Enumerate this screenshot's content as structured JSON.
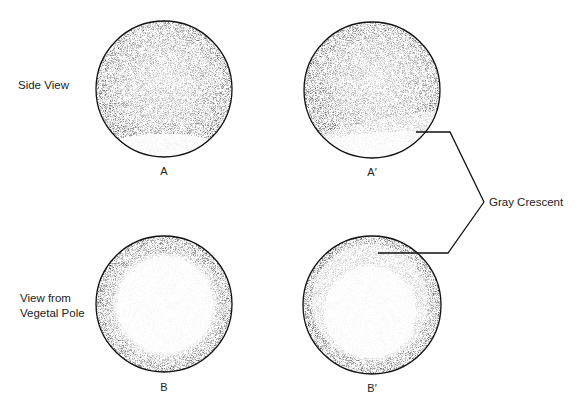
{
  "diagram": {
    "row_labels": {
      "side_view": "Side View",
      "vegetal_view_line1": "View from",
      "vegetal_view_line2": "Vegetal Pole"
    },
    "panels": [
      {
        "id": "A",
        "label": "A",
        "view": "side",
        "gray_crescent": false
      },
      {
        "id": "A2",
        "label": "A′",
        "view": "side",
        "gray_crescent": true
      },
      {
        "id": "B",
        "label": "B",
        "view": "vegetal",
        "gray_crescent": false
      },
      {
        "id": "B2",
        "label": "B′",
        "view": "vegetal",
        "gray_crescent": true
      }
    ],
    "callout": {
      "label": "Gray Crescent",
      "targets": [
        "A′",
        "B′"
      ]
    },
    "colors": {
      "background": "#ffffff",
      "stipple": "#1a1a1a",
      "outline": "#111111",
      "leader_line": "#111111"
    }
  }
}
